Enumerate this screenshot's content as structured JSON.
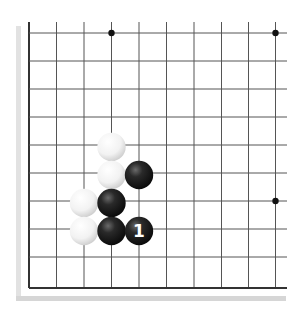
{
  "diagram": {
    "colors": {
      "background": "#ffffff",
      "grid_line": "#555555",
      "edge_line": "#333333",
      "shadow": "#d8d8d8",
      "star_point": "#111111",
      "black_stone": "#1a1a1a",
      "white_stone": "#f4f4f4",
      "label_on_black": "#ffffff"
    },
    "grid": {
      "columns_x": [
        29,
        56.5,
        84,
        111.5,
        139,
        166.5,
        194,
        221.5,
        248.5,
        275.5
      ],
      "rows_y": [
        33,
        61,
        89,
        117,
        145,
        173,
        201,
        229,
        257,
        288
      ],
      "visible_left_edge": true,
      "visible_bottom_edge": true
    },
    "star_points": [
      {
        "col": 3,
        "row": 0
      },
      {
        "col": 9,
        "row": 0
      },
      {
        "col": 9,
        "row": 6
      }
    ],
    "stones": [
      {
        "color": "white",
        "col": 3,
        "row": 4,
        "label": ""
      },
      {
        "color": "white",
        "col": 3,
        "row": 5,
        "label": ""
      },
      {
        "color": "black",
        "col": 4,
        "row": 5,
        "label": ""
      },
      {
        "color": "white",
        "col": 2,
        "row": 6,
        "label": ""
      },
      {
        "color": "black",
        "col": 3,
        "row": 6,
        "label": ""
      },
      {
        "color": "white",
        "col": 2,
        "row": 7,
        "label": ""
      },
      {
        "color": "black",
        "col": 3,
        "row": 7,
        "label": ""
      },
      {
        "color": "black",
        "col": 4,
        "row": 7,
        "label": "1"
      }
    ]
  }
}
